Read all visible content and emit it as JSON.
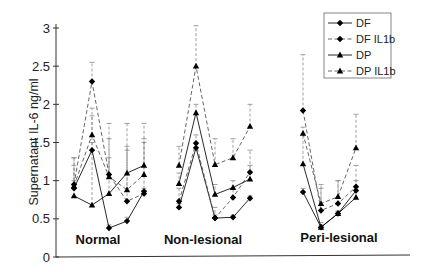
{
  "chart_data": {
    "type": "line",
    "title": "",
    "xlabel": "",
    "ylabel": "Supernatant IL-6 ng/ml",
    "ylim": [
      0,
      3
    ],
    "yticks": [
      0,
      0.5,
      1,
      1.5,
      2,
      2.5,
      3
    ],
    "ytick_labels": [
      "0",
      "0.5",
      "1",
      "1.5",
      "2",
      "2.5",
      "3"
    ],
    "grid": false,
    "legend_position": "upper right",
    "groups": [
      {
        "label": "Normal",
        "n_points": 5
      },
      {
        "label": "Non-lesional",
        "n_points": 5
      },
      {
        "label": "Peri-lesional",
        "n_points": 4
      }
    ],
    "series": [
      {
        "name": "DF",
        "line": "solid",
        "marker": "diamond",
        "values": {
          "Normal": [
            0.9,
            1.4,
            0.38,
            0.47,
            0.86
          ],
          "Non-lesional": [
            0.65,
            1.43,
            0.51,
            0.52,
            0.77
          ],
          "Peri-lesional": [
            0.85,
            0.39,
            0.57,
            0.87
          ]
        },
        "error_upper": {
          "Normal": [
            1.0,
            1.5,
            0.42,
            0.52,
            0.9
          ],
          "Non-lesional": [
            0.7,
            1.5,
            0.55,
            0.55,
            0.8
          ],
          "Peri-lesional": [
            0.9,
            0.42,
            0.6,
            0.92
          ]
        }
      },
      {
        "name": "DF IL1b",
        "line": "dashed",
        "marker": "diamond",
        "values": {
          "Normal": [
            0.95,
            2.3,
            1.08,
            0.73,
            0.83
          ],
          "Non-lesional": [
            0.73,
            1.49,
            0.51,
            0.78,
            1.11
          ],
          "Peri-lesional": [
            1.92,
            0.61,
            0.7,
            0.92
          ]
        },
        "error_upper": {
          "Normal": [
            1.3,
            2.55,
            1.75,
            1.75,
            1.75
          ],
          "Non-lesional": [
            0.9,
            1.6,
            0.65,
            0.9,
            1.2
          ],
          "Peri-lesional": [
            2.65,
            0.9,
            1.0,
            1.2
          ]
        }
      },
      {
        "name": "DP",
        "line": "solid",
        "marker": "triangle",
        "values": {
          "Normal": [
            0.8,
            0.68,
            0.83,
            1.1,
            1.2
          ],
          "Non-lesional": [
            0.96,
            1.89,
            0.82,
            0.91,
            1.02
          ],
          "Peri-lesional": [
            1.22,
            0.39,
            0.57,
            0.78
          ]
        },
        "error_upper": {
          "Normal": [
            1.2,
            1.85,
            1.3,
            1.4,
            1.5
          ],
          "Non-lesional": [
            1.1,
            2.0,
            0.95,
            1.0,
            1.4
          ],
          "Peri-lesional": [
            1.6,
            0.45,
            0.6,
            1.0
          ]
        }
      },
      {
        "name": "DP IL1b",
        "line": "dashed",
        "marker": "triangle",
        "values": {
          "Normal": [
            0.93,
            1.6,
            1.05,
            0.88,
            1.08
          ],
          "Non-lesional": [
            1.2,
            2.5,
            1.21,
            1.3,
            1.71
          ],
          "Peri-lesional": [
            1.62,
            0.7,
            0.79,
            1.43
          ]
        },
        "error_upper": {
          "Normal": [
            1.3,
            1.95,
            1.55,
            1.45,
            1.55
          ],
          "Non-lesional": [
            1.45,
            3.03,
            1.55,
            1.55,
            2.0
          ],
          "Peri-lesional": [
            1.7,
            0.95,
            1.0,
            1.87
          ]
        }
      }
    ]
  },
  "layout": {
    "x_positions": {
      "Normal": [
        74,
        92,
        109,
        127,
        144
      ],
      "Non-lesional": [
        179,
        196,
        215,
        233,
        250
      ],
      "Peri-lesional": [
        303,
        321,
        338,
        356
      ]
    },
    "group_label_positions": {
      "Normal": [
        98,
        244
      ],
      "Non-lesional": [
        203,
        244
      ],
      "Peri-lesional": [
        339,
        242
      ]
    }
  },
  "colors": {
    "line": "#111111",
    "dashed_line": "#555555",
    "error_bar": "#888888",
    "axis": "#333333"
  }
}
